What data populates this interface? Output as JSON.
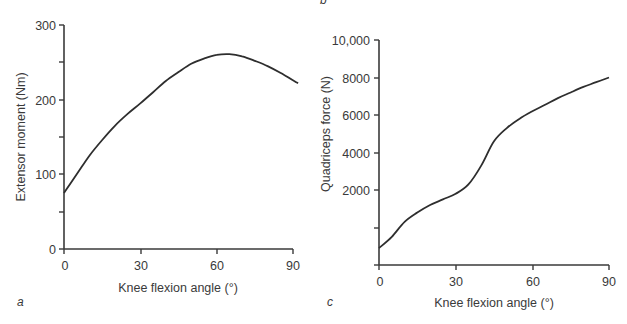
{
  "chart_data": [
    {
      "panel": "a",
      "type": "line",
      "title": "",
      "xlabel": "Knee flexion angle (°)",
      "ylabel": "Extensor moment (Nm)",
      "xlim": [
        0,
        92
      ],
      "ylim": [
        0,
        300
      ],
      "x_ticks": [
        0,
        30,
        60,
        90
      ],
      "y_ticks": [
        0,
        100,
        200,
        300
      ],
      "y_minor_ticks": [
        50,
        150,
        250
      ],
      "grid": false,
      "series": [
        {
          "name": "Extensor moment",
          "x": [
            0,
            5,
            10,
            15,
            20,
            25,
            30,
            35,
            40,
            45,
            50,
            55,
            60,
            65,
            70,
            75,
            80,
            85,
            92
          ],
          "values": [
            75,
            100,
            125,
            146,
            165,
            181,
            195,
            210,
            225,
            237,
            248,
            255,
            260,
            261,
            258,
            252,
            245,
            236,
            222
          ]
        }
      ]
    },
    {
      "panel": "c",
      "type": "line",
      "title": "",
      "xlabel": "Knee flexion angle (°)",
      "ylabel": "Quadriceps force (N)",
      "xlim": [
        0,
        90
      ],
      "ylim": [
        0,
        12000
      ],
      "x_ticks": [
        0,
        30,
        60,
        90
      ],
      "y_ticks": [
        2000,
        4000,
        6000,
        8000,
        10000
      ],
      "y_tick_labels": [
        "2000",
        "4000",
        "6000",
        "8000",
        "10,000"
      ],
      "y_unlabeled_ticks": [
        0
      ],
      "grid": false,
      "series": [
        {
          "name": "Quadriceps force",
          "x": [
            0,
            5,
            10,
            15,
            20,
            25,
            30,
            35,
            40,
            45,
            50,
            55,
            60,
            65,
            70,
            75,
            80,
            85,
            90
          ],
          "values": [
            900,
            1500,
            2300,
            2800,
            3200,
            3500,
            3800,
            4300,
            5300,
            6600,
            7300,
            7800,
            8200,
            8550,
            8900,
            9200,
            9500,
            9750,
            10000
          ]
        }
      ]
    }
  ],
  "panels": {
    "a": {
      "label": "a",
      "ylabel": "Extensor moment (Nm)",
      "xlabel": "Knee flexion angle (°)",
      "y_tick_labels": [
        "0",
        "100",
        "200",
        "300"
      ],
      "x_tick_labels": [
        "0",
        "30",
        "60",
        "90"
      ]
    },
    "b": {
      "label": "b"
    },
    "c": {
      "label": "c",
      "ylabel": "Quadriceps force (N)",
      "xlabel": "Knee flexion angle (°)",
      "y_tick_labels": [
        "2000",
        "4000",
        "6000",
        "8000",
        "10,000"
      ],
      "x_tick_labels": [
        "0",
        "30",
        "60",
        "90"
      ]
    }
  }
}
